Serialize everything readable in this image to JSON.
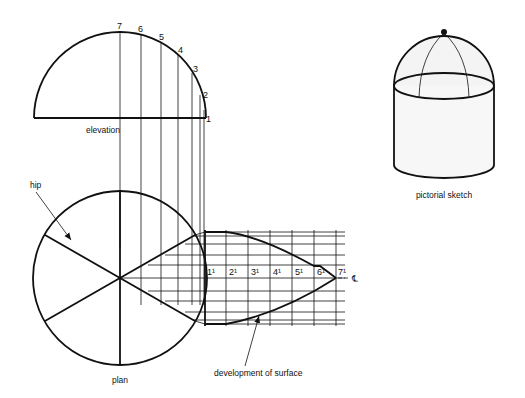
{
  "labels": {
    "elevation": "elevation",
    "plan": "plan",
    "hip": "hip",
    "development": "development of surface",
    "pictorial": "pictorial sketch",
    "centerline": "℄"
  },
  "elevation_points": [
    "1",
    "2",
    "3",
    "4",
    "5",
    "6",
    "7"
  ],
  "development_points": [
    "1¹",
    "2¹",
    "3¹",
    "4¹",
    "5¹",
    "6¹",
    "7¹"
  ],
  "colors": {
    "ink": "#111111",
    "paper": "#ffffff"
  }
}
